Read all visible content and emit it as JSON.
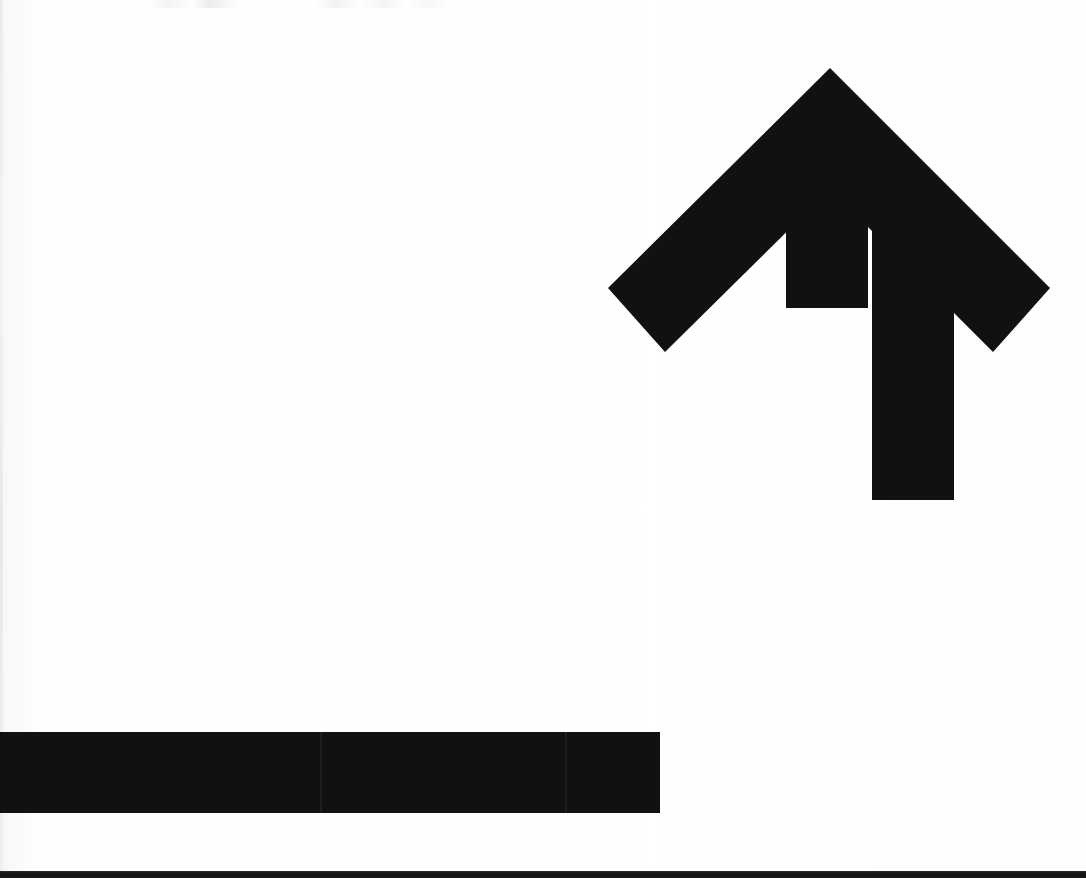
{
  "image": {
    "kind": "scanned-line-art",
    "subject_label": "curved upward arrow",
    "width": 1086,
    "height": 878,
    "background_color": "#fdfdfd",
    "ink_color": "#111111",
    "bottom_edge_color": "#1b1b1b"
  },
  "graphic": {
    "name": "curved-up-arrow",
    "description": "Thick black arrow entering from the left edge as a horizontal bar, curving upward through a quarter turn and terminating in a large chevron arrowhead pointing up",
    "stroke_thickness_px": 82,
    "direction": "up",
    "tail_side": "left",
    "arrowhead_style": "chevron",
    "arrowhead": {
      "tip_x": 830,
      "tip_y": 68,
      "left_wing_tip_x": 608,
      "left_wing_tip_y": 288,
      "right_wing_tip_x": 1050,
      "right_wing_tip_y": 288,
      "wing_bottom_left_x": 665,
      "wing_bottom_left_y": 352,
      "wing_bottom_right_x": 993,
      "wing_bottom_right_y": 352
    },
    "shaft": {
      "left_x": 786,
      "right_x": 872,
      "top_y": 228,
      "curve_start_y": 470,
      "curve_radius_px": 175
    },
    "tail": {
      "start_x": 0,
      "end_x": 640,
      "top_y": 732,
      "bottom_y": 813
    },
    "path": "M 830 68 L 1050 288 L 993 352 L 872 231 L 872 470 C 872 640 800 732 640 732 L 0 732 L 0 813 L 648 813 C 862 813 954 690 954 470 L 954 231 L 665 352 L 608 288 Z",
    "artifacts": [
      {
        "name": "seam-line-tail",
        "x": 320,
        "y": 731
      },
      {
        "name": "seam-line-curve",
        "x": 565,
        "y": 700
      },
      {
        "name": "seam-line-arrowhead",
        "x": 700,
        "y": 380
      },
      {
        "name": "top-edge-ghost-marks",
        "x": 150,
        "y": 0
      },
      {
        "name": "bottom-scan-edge-band",
        "x": 0,
        "y": 871
      }
    ]
  }
}
